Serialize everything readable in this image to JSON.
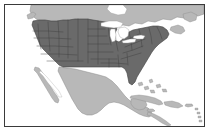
{
  "figure": {
    "alt_text": "Grayscale reference map showing the lower 48 United States shaded dark gray with internal state boundaries, surrounded by Canada, Mexico, Cuba and Caribbean islands in light gray, oceans and Great Lakes in white, enclosed in a thin rectangular border.",
    "frame": {
      "x": 4,
      "y": 4,
      "width": 201,
      "height": 123,
      "border_color": "#3a3a3a",
      "border_width_px": 1
    },
    "canvas": {
      "width": 212,
      "height": 137,
      "background_color": "#ffffff"
    }
  },
  "colors": {
    "highlight_fill": "#6a6a6a",
    "highlight_stroke": "#3f3f3f",
    "context_fill": "#b8b8b8",
    "context_stroke": "#8a8a8a",
    "water_fill": "#ffffff",
    "lake_stroke": "#9a9a9a",
    "page_background": "#ffffff",
    "frame_border": "#3a3a3a"
  },
  "regions": [
    {
      "id": "canada",
      "name": "Canada",
      "role": "context",
      "highlighted": false,
      "fill": "#b8b8b8"
    },
    {
      "id": "united-states",
      "name": "United States (contiguous 48)",
      "role": "highlighted",
      "highlighted": true,
      "fill": "#6a6a6a"
    },
    {
      "id": "mexico",
      "name": "Mexico",
      "role": "context",
      "highlighted": false,
      "fill": "#b8b8b8"
    },
    {
      "id": "central-america",
      "name": "Central America",
      "role": "context",
      "highlighted": false,
      "fill": "#b8b8b8"
    },
    {
      "id": "cuba",
      "name": "Cuba",
      "role": "context",
      "highlighted": false,
      "fill": "#b8b8b8"
    },
    {
      "id": "hispaniola",
      "name": "Hispaniola",
      "role": "context",
      "highlighted": false,
      "fill": "#b8b8b8"
    },
    {
      "id": "jamaica",
      "name": "Jamaica",
      "role": "context",
      "highlighted": false,
      "fill": "#b8b8b8"
    },
    {
      "id": "puerto-rico",
      "name": "Puerto Rico",
      "role": "context",
      "highlighted": false,
      "fill": "#b8b8b8"
    },
    {
      "id": "bahamas",
      "name": "Bahamas",
      "role": "context",
      "highlighted": false,
      "fill": "#b8b8b8"
    },
    {
      "id": "lesser-antilles",
      "name": "Lesser Antilles",
      "role": "context",
      "highlighted": false,
      "fill": "#b8b8b8"
    },
    {
      "id": "newfoundland",
      "name": "Newfoundland",
      "role": "context",
      "highlighted": false,
      "fill": "#b8b8b8"
    },
    {
      "id": "nova-scotia",
      "name": "Nova Scotia",
      "role": "context",
      "highlighted": false,
      "fill": "#b8b8b8"
    },
    {
      "id": "baja-california",
      "name": "Baja California",
      "role": "context",
      "highlighted": false,
      "fill": "#b8b8b8"
    },
    {
      "id": "yucatan",
      "name": "Yucatan Peninsula",
      "role": "context",
      "highlighted": false,
      "fill": "#b8b8b8"
    },
    {
      "id": "vancouver-island",
      "name": "Vancouver Island",
      "role": "context",
      "highlighted": false,
      "fill": "#b8b8b8"
    }
  ],
  "water_bodies": [
    {
      "id": "lake-superior",
      "name": "Lake Superior"
    },
    {
      "id": "lake-michigan",
      "name": "Lake Michigan"
    },
    {
      "id": "lake-huron",
      "name": "Lake Huron"
    },
    {
      "id": "lake-erie",
      "name": "Lake Erie"
    },
    {
      "id": "lake-ontario",
      "name": "Lake Ontario"
    },
    {
      "id": "atlantic-ocean",
      "name": "Atlantic Ocean"
    },
    {
      "id": "pacific-ocean",
      "name": "Pacific Ocean"
    },
    {
      "id": "gulf-of-mexico",
      "name": "Gulf of Mexico"
    },
    {
      "id": "gulf-of-california",
      "name": "Gulf of California"
    },
    {
      "id": "hudson-bay",
      "name": "Hudson Bay"
    }
  ],
  "state_boundaries": {
    "visible": true,
    "stroke": "#3f3f3f",
    "description": "Internal state outlines drawn within the highlighted United States"
  },
  "labels": {
    "visible": false,
    "items": []
  }
}
